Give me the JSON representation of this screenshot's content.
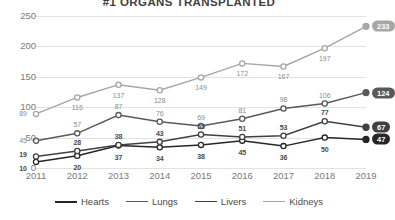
{
  "chart_data": {
    "type": "line",
    "title": "#1 ORGANS TRANSPLANTED",
    "xlabel": "",
    "ylabel": "",
    "categories": [
      "2011",
      "2012",
      "2013",
      "2014",
      "2015",
      "2016",
      "2017",
      "2018",
      "2019"
    ],
    "ylim": [
      0,
      250
    ],
    "yticks": [
      0,
      50,
      100,
      150,
      200,
      250
    ],
    "grid": true,
    "legend_position": "bottom",
    "series": [
      {
        "name": "Hearts",
        "values": [
          10,
          20,
          37,
          34,
          38,
          45,
          36,
          50,
          47
        ],
        "color": "#262626",
        "end_label": "47"
      },
      {
        "name": "Lungs",
        "values": [
          45,
          57,
          87,
          76,
          69,
          81,
          98,
          106,
          124
        ],
        "color": "#595959",
        "end_label": "124"
      },
      {
        "name": "Livers",
        "values": [
          19,
          28,
          38,
          43,
          55,
          51,
          53,
          77,
          67
        ],
        "color": "#404040",
        "end_label": "67"
      },
      {
        "name": "Kidneys",
        "values": [
          89,
          116,
          137,
          128,
          149,
          172,
          167,
          197,
          233
        ],
        "color": "#a6a6a6",
        "end_label": "233"
      }
    ]
  },
  "legend": {
    "items": [
      {
        "label": "Hearts"
      },
      {
        "label": "Lungs"
      },
      {
        "label": "Livers"
      },
      {
        "label": "Kidneys"
      }
    ]
  }
}
